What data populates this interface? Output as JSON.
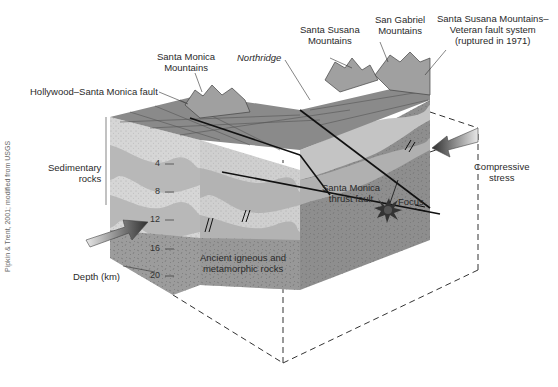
{
  "figure": {
    "type": "block-diagram",
    "labels": {
      "santa_monica_mountains": "Santa Monica\nMountains",
      "northridge": "Northridge",
      "santa_susana_mountains": "Santa Susana\nMountains",
      "san_gabriel_mountains": "San Gabriel\nMountains",
      "veteran_fault": "Santa Susana Mountains–\nVeteran fault system\n(ruptured in 1971)",
      "hollywood_fault": "Hollywood–Santa Monica fault",
      "sedimentary_rocks": "Sedimentary\nrocks",
      "compressive_stress": "Compressive\nstress",
      "thrust_fault": "Santa Monica\nthrust fault",
      "focus": "Focus",
      "ancient_rocks": "Ancient igneous and\nmetamorphic rocks",
      "depth_axis": "Depth (km)"
    },
    "depth_ticks": [
      "4",
      "8",
      "12",
      "16",
      "20"
    ],
    "credit": "Pipkin & Trent, 2001; modified from USGS",
    "colors": {
      "sediment_light": "#d9d9d9",
      "sediment_mid": "#b5b5b5",
      "basement": "#9a9a9a",
      "basement_right": "#8c8c8c",
      "surface_grid": "#7a7a7a",
      "mountains": "#9e9e9e",
      "focus": "#333333",
      "arrow_dark": "#3a3a3a",
      "arrow_light": "#e6e6e6"
    }
  }
}
